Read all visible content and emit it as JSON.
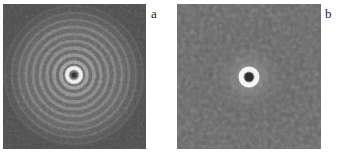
{
  "figure": {
    "panels": [
      {
        "id": "a",
        "label": "a",
        "description": "Concentric ring diffraction pattern with many bright rings around a dark center",
        "background_color": "#4e4e4e",
        "center_color": "#3a3a3a",
        "ring_color": "#f2f2f2"
      },
      {
        "id": "b",
        "label": "b",
        "description": "Single bright ring around a dark center with diffuse halo and speckled background",
        "background_color": "#4a4a4a",
        "center_color": "#2e2e2e",
        "ring_color": "#f5f5f5"
      }
    ]
  }
}
